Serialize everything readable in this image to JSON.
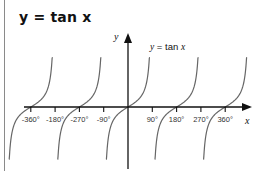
{
  "title": "y = tan x",
  "chart_data": {
    "type": "line",
    "title": "y = tan x",
    "xlabel": "x",
    "ylabel": "y",
    "series": [
      {
        "name": "y = tan x",
        "function": "tan(x)"
      }
    ],
    "x_ticks": [
      "-360°",
      "-180°",
      "-270°",
      "-90°",
      "90°",
      "180°",
      "270°",
      "360°"
    ],
    "x_tick_values": [
      -360,
      -270,
      -180,
      -90,
      90,
      180,
      270,
      360
    ],
    "xlim": [
      -405,
      400
    ],
    "ylim": [
      -6,
      6
    ],
    "annotations": [
      "y = tan x"
    ],
    "grid": false,
    "legend": "none",
    "asymptotes": [
      -450,
      -270,
      -90,
      90,
      270
    ]
  },
  "labels": {
    "x_axis": "x",
    "y_axis": "y",
    "curve": "y = tan x",
    "ticks": [
      "-360°",
      "-180°",
      "-270°",
      "-90°",
      "90°",
      "180°",
      "270°",
      "360°"
    ]
  }
}
